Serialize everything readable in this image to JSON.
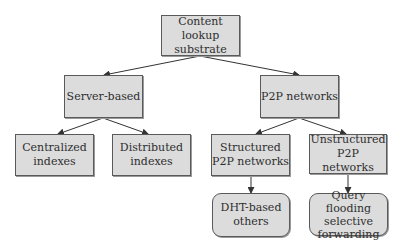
{
  "diagram": {
    "type": "tree",
    "nodes": {
      "root": {
        "label": "Content lookup\nsubstrate"
      },
      "server": {
        "label": "Server-based"
      },
      "p2p": {
        "label": "P2P networks"
      },
      "centralized": {
        "label": "Centralized\nindexes"
      },
      "distributed": {
        "label": "Distributed\nindexes"
      },
      "structured": {
        "label": "Structured\nP2P networks"
      },
      "unstructured": {
        "label": "Unstructured\nP2P networks"
      },
      "dht": {
        "label": "DHT-based\nothers"
      },
      "query": {
        "label": "Query flooding\nselective\nforwarding"
      }
    },
    "edges": [
      {
        "from": "root",
        "to": "server"
      },
      {
        "from": "root",
        "to": "p2p"
      },
      {
        "from": "server",
        "to": "centralized"
      },
      {
        "from": "server",
        "to": "distributed"
      },
      {
        "from": "p2p",
        "to": "structured"
      },
      {
        "from": "p2p",
        "to": "unstructured"
      },
      {
        "from": "structured",
        "to": "dht"
      },
      {
        "from": "unstructured",
        "to": "query"
      }
    ],
    "colors": {
      "box_fill": "#dcdcdc",
      "box_border": "#5a5a5a",
      "text": "#2e2e2e",
      "edge": "#333333"
    }
  }
}
